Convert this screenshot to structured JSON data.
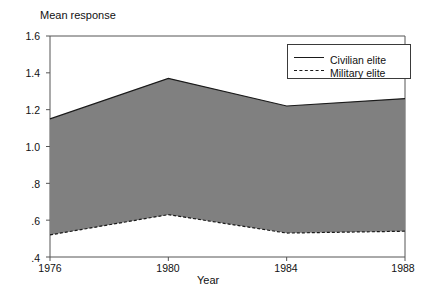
{
  "chart_data": {
    "type": "area",
    "title": "",
    "ylabel": "Mean response",
    "xlabel": "Year",
    "x": [
      1976,
      1980,
      1984,
      1988
    ],
    "xtick_labels": [
      "1976",
      "1980",
      "1984",
      "1988"
    ],
    "xlim": [
      1976,
      1988
    ],
    "ylim": [
      0.4,
      1.6
    ],
    "ytick_values": [
      1.6,
      1.4,
      1.2,
      1.0,
      0.8,
      0.6,
      0.4
    ],
    "ytick_labels": [
      "1.6",
      "1.4",
      "1.2",
      "1.0",
      ".8",
      ".6",
      ".4"
    ],
    "grid": false,
    "legend_position": "upper right",
    "band_fill_color": "#808080",
    "series": [
      {
        "name": "Civilian elite",
        "style": "solid",
        "values": [
          1.15,
          1.37,
          1.22,
          1.26
        ]
      },
      {
        "name": "Military elite",
        "style": "dashed",
        "values": [
          0.52,
          0.63,
          0.53,
          0.54
        ]
      }
    ]
  },
  "legend": {
    "entries": [
      {
        "label": "Civilian elite",
        "style": "solid"
      },
      {
        "label": "Military elite",
        "style": "dashed"
      }
    ]
  }
}
